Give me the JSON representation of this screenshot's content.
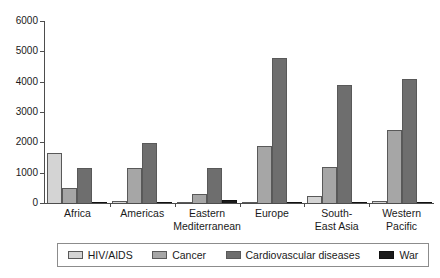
{
  "chart_data": {
    "type": "bar",
    "title": "",
    "subtitle": "",
    "xlabel": "",
    "ylabel": "",
    "ylim": [
      0,
      6000
    ],
    "ytick_step": 1000,
    "yticks": [
      "0",
      "1000",
      "2000",
      "3000",
      "4000",
      "5000",
      "6000"
    ],
    "grid": false,
    "legend_position": "bottom",
    "categories": [
      "Africa",
      "Americas",
      "Eastern\nMediterranean",
      "Europe",
      "South-\nEast Asia",
      "Western\nPacific"
    ],
    "series": [
      {
        "name": "HIV/AIDS",
        "color": "#d4d4d4",
        "values": [
          1650,
          80,
          40,
          40,
          230,
          70
        ]
      },
      {
        "name": "Cancer",
        "color": "#a6a6a6",
        "values": [
          480,
          1170,
          310,
          1870,
          1200,
          2420
        ]
      },
      {
        "name": "Cardiovascular diseases",
        "color": "#6e6e6e",
        "values": [
          1170,
          1970,
          1170,
          4770,
          3890,
          4100
        ]
      },
      {
        "name": "War",
        "color": "#1a1a1a",
        "values": [
          40,
          10,
          110,
          10,
          10,
          10
        ]
      }
    ]
  },
  "legend": {
    "items": [
      {
        "label": "HIV/AIDS"
      },
      {
        "label": "Cancer"
      },
      {
        "label": "Cardiovascular diseases"
      },
      {
        "label": "War"
      }
    ]
  }
}
